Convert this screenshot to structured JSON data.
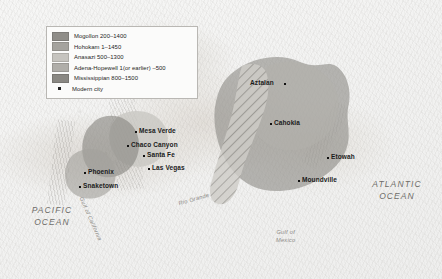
{
  "map": {
    "title": "Pre-Columbian Cultures of North America",
    "background_color": "#efeeec"
  },
  "legend": {
    "border_color": "#b9b7b3",
    "background_color": "#fbfbfa",
    "items": [
      {
        "label": "Mogollon  200–1400",
        "color": "#8f8d88"
      },
      {
        "label": "Hohokam  1–1450",
        "color": "#a5a39e"
      },
      {
        "label": "Anasazi  500–1300",
        "color": "#c6c4bf"
      },
      {
        "label": "Adena-Hopewell  1(or earlier) –500",
        "color": "#b0aea9"
      },
      {
        "label": "Mississippian  800–1500",
        "color": "#8a8883"
      }
    ],
    "city_marker_label": "Modern city"
  },
  "cities": [
    {
      "name": "Mesa Verde",
      "x": 139,
      "y": 130
    },
    {
      "name": "Chaco Canyon",
      "x": 131,
      "y": 144
    },
    {
      "name": "Santa Fe",
      "x": 147,
      "y": 154
    },
    {
      "name": "Las Vegas",
      "x": 152,
      "y": 167
    },
    {
      "name": "Phoenix",
      "x": 88,
      "y": 171
    },
    {
      "name": "Snaketown",
      "x": 83,
      "y": 185
    },
    {
      "name": "Aztalan",
      "x": 250,
      "y": 82
    },
    {
      "name": "Cahokia",
      "x": 274,
      "y": 122
    },
    {
      "name": "Etowah",
      "x": 331,
      "y": 156
    },
    {
      "name": "Moundville",
      "x": 302,
      "y": 179
    }
  ],
  "ocean_labels": [
    {
      "name": "PACIFIC\nOCEAN",
      "line1": "PACIFIC",
      "line2": "OCEAN"
    },
    {
      "name": "ATLANTIC\nOCEAN",
      "line1": "ATLANTIC",
      "line2": "OCEAN"
    }
  ],
  "water_labels": {
    "gulf_of_mexico_line1": "Gulf of",
    "gulf_of_mexico_line2": "Mexico",
    "gulf_of_california": "Gulf of California",
    "rio_grande": "Rio Grande"
  },
  "colors": {
    "mogollon": "#8f8d88",
    "hohokam": "#a5a39e",
    "anasazi": "#c6c4bf",
    "adena_hopewell": "#b0aea9",
    "mississippian": "#8a8883",
    "land": "#e2ded8",
    "water": "#f4f4f3",
    "text": "#1b1b1b"
  }
}
